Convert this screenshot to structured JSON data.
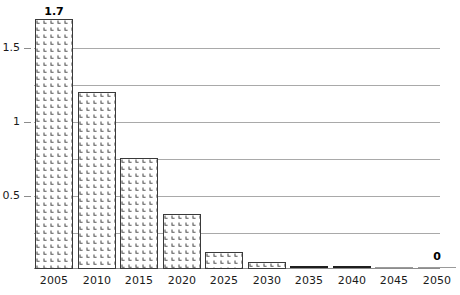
{
  "chart_data": {
    "type": "bar",
    "title": "",
    "subtitle": "",
    "xlabel": "",
    "ylabel": "",
    "categories": [
      "2005",
      "2010",
      "2015",
      "2020",
      "2025",
      "2030",
      "2035",
      "2040",
      "2045",
      "2050"
    ],
    "values": [
      1.7,
      1.2,
      0.75,
      0.37,
      0.11,
      0.04,
      0,
      0,
      0,
      0
    ],
    "ylim": [
      0,
      1.8
    ],
    "y_ticks": [
      0.25,
      0.5,
      0.75,
      1,
      1.25,
      1.5
    ],
    "y_tick_labels": [
      "",
      "0.5",
      "",
      "1",
      "",
      "1.5"
    ],
    "grid": true,
    "legend": "none",
    "data_labels": [
      {
        "category": "2005",
        "text": "1.7"
      },
      {
        "category": "2050",
        "text": "0"
      }
    ],
    "series": [
      {
        "name": "series-1",
        "values": [
          1.7,
          1.2,
          0.75,
          0.37,
          0.11,
          0.04,
          0,
          0,
          0,
          0
        ]
      }
    ]
  },
  "axis": {
    "y_labels": [
      {
        "text": "1.5",
        "value": 1.5
      },
      {
        "text": "1",
        "value": 1
      },
      {
        "text": "0.5",
        "value": 0.5
      }
    ],
    "x_labels": [
      "2005",
      "2010",
      "2015",
      "2020",
      "2025",
      "2030",
      "2035",
      "2040",
      "2045",
      "2050"
    ]
  },
  "labels": {
    "first_bar_value": "1.7",
    "last_bar_value": "0"
  },
  "colors": {
    "bar_border": "#3a3a3a",
    "bar_hatch": "#555555",
    "bar_fill": "#ffffff",
    "gridline": "#a9a9a9",
    "baseline": "#8c8c8c",
    "flat_dark": "#1f1f1f",
    "flat_light": "#9a9a9a",
    "text": "#1a1a1a",
    "background": "#ffffff"
  }
}
